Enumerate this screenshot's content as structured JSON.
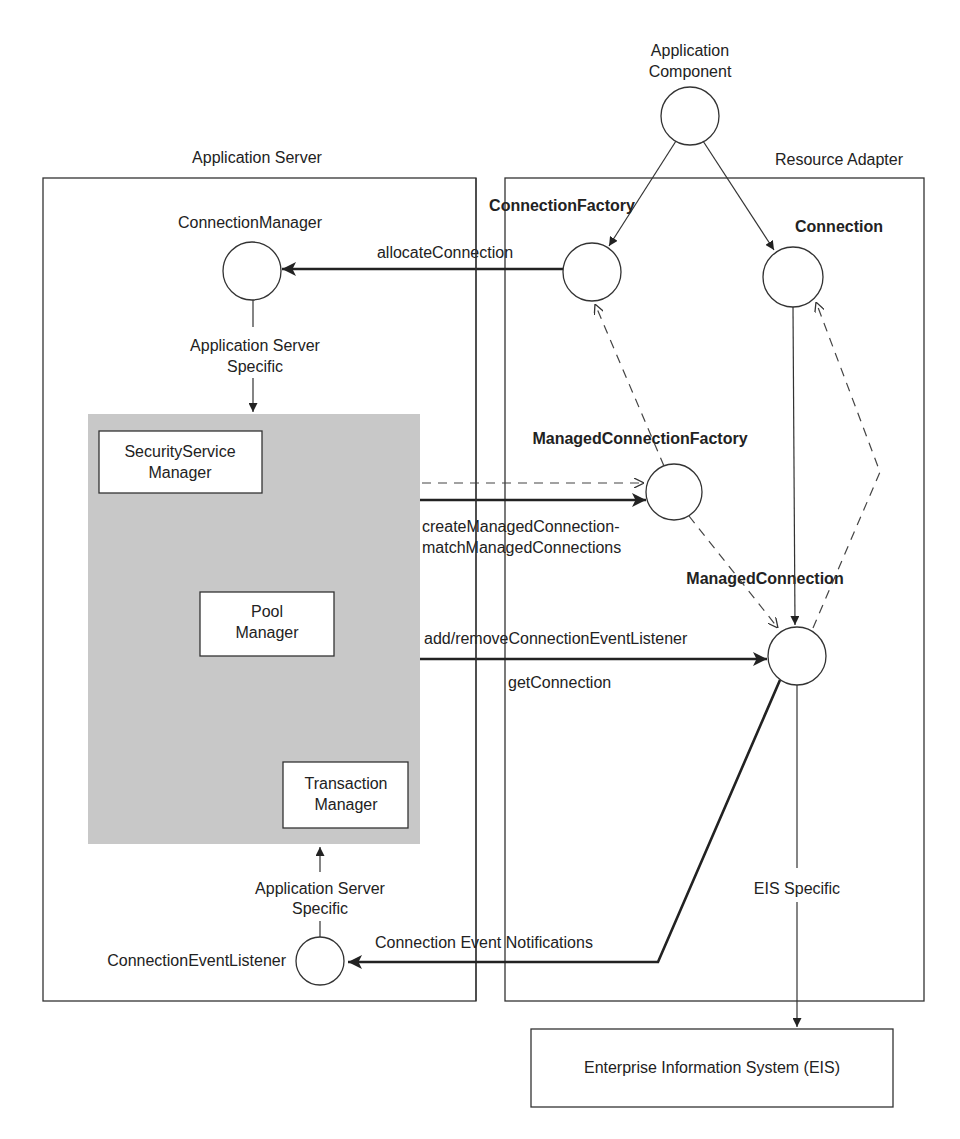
{
  "diagram": {
    "containers": {
      "app_server": {
        "label": "Application Server"
      },
      "resource_adapter": {
        "label": "Resource Adapter"
      },
      "eis": {
        "label": "Enterprise Information System (EIS)"
      }
    },
    "nodes": {
      "application_component": {
        "line1": "Application",
        "line2": "Component"
      },
      "connection_manager": {
        "label": "ConnectionManager"
      },
      "connection_factory": {
        "label": "ConnectionFactory"
      },
      "connection": {
        "label": "Connection"
      },
      "managed_connection_factory": {
        "label": "ManagedConnectionFactory"
      },
      "managed_connection": {
        "label": "ManagedConnection"
      },
      "connection_event_listener": {
        "label": "ConnectionEventListener"
      }
    },
    "internal_boxes": {
      "security_service_manager": {
        "line1": "SecurityService",
        "line2": "Manager"
      },
      "pool_manager": {
        "line1": "Pool",
        "line2": "Manager"
      },
      "transaction_manager": {
        "line1": "Transaction",
        "line2": "Manager"
      }
    },
    "edges": {
      "allocate_connection": "allocateConnection",
      "app_server_specific_top": {
        "line1": "Application Server",
        "line2": "Specific"
      },
      "app_server_specific_bottom": {
        "line1": "Application Server",
        "line2": "Specific"
      },
      "create_match": {
        "line1": "createManagedConnection-",
        "line2": "matchManagedConnections"
      },
      "add_remove_listener": "add/removeConnectionEventListener",
      "get_connection": "getConnection",
      "connection_event_notifications": "Connection Event Notifications",
      "eis_specific": "EIS Specific"
    },
    "colors": {
      "line": "#333333",
      "pool_fill": "#c8c8c8",
      "background": "#ffffff"
    }
  }
}
